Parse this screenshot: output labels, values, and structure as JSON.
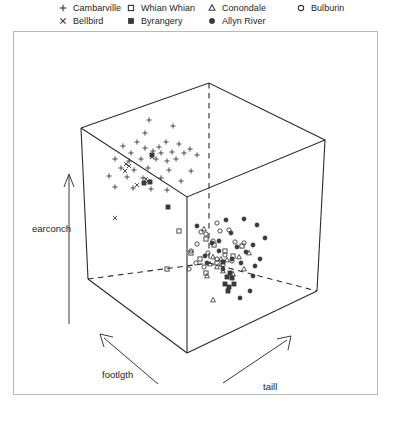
{
  "legend": {
    "columns": [
      {
        "x": 57,
        "entries": [
          {
            "label": "Cambarville",
            "marker": "plus"
          },
          {
            "label": "Bellbird",
            "marker": "cross"
          }
        ]
      },
      {
        "x": 125,
        "entries": [
          {
            "label": "Whian Whian",
            "marker": "open-square"
          },
          {
            "label": "Byrangery",
            "marker": "filled-square"
          }
        ]
      },
      {
        "x": 206,
        "entries": [
          {
            "label": "Conondale",
            "marker": "open-triangle"
          },
          {
            "label": "Allyn River",
            "marker": "filled-circle"
          }
        ]
      },
      {
        "x": 295,
        "entries": [
          {
            "label": "Bulburin",
            "marker": "open-circle"
          }
        ]
      }
    ]
  },
  "axes": {
    "earconch": "earconch",
    "footlgth": "footlgth",
    "taill": "taill"
  },
  "colors": {
    "frame": "#b9b9b9",
    "cube": "#2b2b2b",
    "marker": "#3a3a3a",
    "text": "#1d1d1d"
  },
  "chart_data": {
    "type": "scatter",
    "title": "",
    "subtitle": "",
    "xlabel": "taill",
    "ylabel": "earconch",
    "zlabel": "footlgth",
    "projection": "3d-cloud",
    "grid": false,
    "legend_position": "top",
    "axis_arrows": [
      "earconch up",
      "footlgth lower-left",
      "taill lower-right"
    ],
    "cube_vertices_px": {
      "top_back": [
        208,
        82
      ],
      "top_left": [
        80,
        127
      ],
      "top_right": [
        324,
        139
      ],
      "top_front": [
        186,
        196
      ],
      "bottom_left": [
        87,
        278
      ],
      "bottom_right": [
        316,
        290
      ],
      "bottom_front": [
        186,
        352
      ],
      "bottom_back": [
        208,
        262
      ]
    },
    "series": [
      {
        "name": "Cambarville",
        "marker": "plus",
        "count": 36,
        "points": [
          [
            148,
            119
          ],
          [
            172,
            125
          ],
          [
            144,
            132
          ],
          [
            136,
            141
          ],
          [
            165,
            141
          ],
          [
            122,
            145
          ],
          [
            144,
            147
          ],
          [
            158,
            146
          ],
          [
            178,
            143
          ],
          [
            189,
            148
          ],
          [
            130,
            152
          ],
          [
            152,
            150
          ],
          [
            160,
            152
          ],
          [
            171,
            151
          ],
          [
            183,
            152
          ],
          [
            114,
            158
          ],
          [
            128,
            160
          ],
          [
            140,
            158
          ],
          [
            155,
            158
          ],
          [
            166,
            160
          ],
          [
            175,
            158
          ],
          [
            196,
            154
          ],
          [
            120,
            167
          ],
          [
            133,
            169
          ],
          [
            147,
            167
          ],
          [
            168,
            169
          ],
          [
            190,
            170
          ],
          [
            108,
            175
          ],
          [
            126,
            176
          ],
          [
            142,
            177
          ],
          [
            160,
            177
          ],
          [
            180,
            180
          ],
          [
            114,
            186
          ],
          [
            132,
            187
          ],
          [
            150,
            188
          ],
          [
            166,
            189
          ]
        ]
      },
      {
        "name": "Bellbird",
        "marker": "cross",
        "count": 8,
        "points": [
          [
            125,
            163
          ],
          [
            128,
            165
          ],
          [
            124,
            170
          ],
          [
            145,
            178
          ],
          [
            147,
            180
          ],
          [
            114,
            217
          ],
          [
            136,
            184
          ],
          [
            151,
            156
          ]
        ]
      },
      {
        "name": "Whian Whian",
        "marker": "open-square",
        "count": 11,
        "points": [
          [
            178,
            230
          ],
          [
            205,
            238
          ],
          [
            213,
            244
          ],
          [
            224,
            250
          ],
          [
            232,
            255
          ],
          [
            199,
            258
          ],
          [
            216,
            262
          ],
          [
            166,
            268
          ],
          [
            205,
            272
          ],
          [
            241,
            245
          ],
          [
            190,
            252
          ]
        ]
      },
      {
        "name": "Byrangery",
        "marker": "filled-square",
        "count": 12,
        "points": [
          [
            151,
            154
          ],
          [
            149,
            181
          ],
          [
            143,
            182
          ],
          [
            167,
            206
          ],
          [
            222,
            261
          ],
          [
            229,
            272
          ],
          [
            226,
            276
          ],
          [
            231,
            277
          ],
          [
            224,
            283
          ],
          [
            228,
            286
          ],
          [
            233,
            283
          ],
          [
            227,
            290
          ]
        ]
      },
      {
        "name": "Conondale",
        "marker": "open-triangle",
        "count": 13,
        "points": [
          [
            203,
            228
          ],
          [
            212,
            256
          ],
          [
            220,
            258
          ],
          [
            226,
            259
          ],
          [
            238,
            256
          ],
          [
            209,
            263
          ],
          [
            216,
            266
          ],
          [
            243,
            268
          ],
          [
            222,
            270
          ],
          [
            232,
            273
          ],
          [
            206,
            275
          ],
          [
            212,
            299
          ],
          [
            248,
            252
          ]
        ]
      },
      {
        "name": "Allyn River",
        "marker": "filled-circle",
        "count": 22,
        "points": [
          [
            225,
            219
          ],
          [
            243,
            218
          ],
          [
            256,
            224
          ],
          [
            196,
            225
          ],
          [
            230,
            232
          ],
          [
            264,
            237
          ],
          [
            211,
            242
          ],
          [
            236,
            246
          ],
          [
            218,
            250
          ],
          [
            245,
            251
          ],
          [
            252,
            244
          ],
          [
            204,
            255
          ],
          [
            231,
            258
          ],
          [
            240,
            262
          ],
          [
            254,
            265
          ],
          [
            259,
            258
          ],
          [
            206,
            262
          ],
          [
            222,
            268
          ],
          [
            252,
            275
          ],
          [
            249,
            290
          ],
          [
            239,
            297
          ],
          [
            218,
            240
          ]
        ]
      },
      {
        "name": "Bulburin",
        "marker": "open-circle",
        "count": 18,
        "points": [
          [
            216,
            222
          ],
          [
            200,
            231
          ],
          [
            205,
            233
          ],
          [
            219,
            230
          ],
          [
            228,
            229
          ],
          [
            196,
            243
          ],
          [
            212,
            240
          ],
          [
            234,
            241
          ],
          [
            243,
            242
          ],
          [
            190,
            250
          ],
          [
            207,
            252
          ],
          [
            224,
            254
          ],
          [
            195,
            262
          ],
          [
            216,
            258
          ],
          [
            231,
            260
          ],
          [
            188,
            268
          ],
          [
            203,
            266
          ],
          [
            222,
            264
          ]
        ]
      }
    ]
  }
}
